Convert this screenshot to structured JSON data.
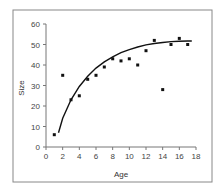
{
  "chart_data": {
    "type": "scatter",
    "title": "",
    "xlabel": "Age",
    "ylabel": "Size",
    "xlim": [
      0,
      18
    ],
    "ylim": [
      0,
      60
    ],
    "xticks": [
      0,
      2,
      4,
      6,
      8,
      10,
      12,
      14,
      16,
      18
    ],
    "yticks": [
      0,
      10,
      20,
      30,
      40,
      50,
      60
    ],
    "grid": false,
    "legend": null,
    "series": [
      {
        "name": "Observed",
        "type": "scatter",
        "x": [
          1,
          2,
          3,
          4,
          5,
          6,
          7,
          8,
          9,
          10,
          11,
          12,
          13,
          14,
          15,
          16,
          17
        ],
        "y": [
          6,
          35,
          23,
          25,
          33,
          35,
          39,
          43,
          42,
          43,
          40,
          47,
          52,
          28,
          50,
          53,
          50
        ]
      },
      {
        "name": "Fitted curve",
        "type": "line",
        "x": [
          1.5,
          2,
          3,
          4,
          5,
          6,
          7,
          8,
          9,
          10,
          11,
          12,
          13,
          14,
          15,
          16,
          17,
          17.5
        ],
        "y": [
          7,
          14,
          23,
          29.5,
          34.5,
          38.5,
          41.5,
          44,
          46,
          47.5,
          48.8,
          49.8,
          50.5,
          51,
          51.4,
          51.6,
          51.7,
          51.7
        ]
      }
    ]
  }
}
